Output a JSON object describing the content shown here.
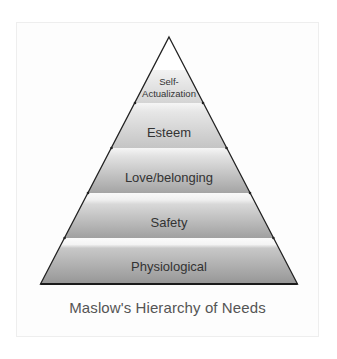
{
  "diagram": {
    "type": "pyramid",
    "caption": "Maslow's Hierarchy of Needs",
    "levels": [
      {
        "label_line1": "Self-",
        "label_line2": "Actualization",
        "rank": 5
      },
      {
        "label": "Esteem",
        "rank": 4
      },
      {
        "label": "Love/belonging",
        "rank": 3
      },
      {
        "label": "Safety",
        "rank": 2
      },
      {
        "label": "Physiological",
        "rank": 1
      }
    ],
    "colors": {
      "outline": "#222222",
      "band_top": "#f4f4f4",
      "band_bottom": "#8e8e8e",
      "text": "#333333",
      "caption": "#555555"
    }
  }
}
